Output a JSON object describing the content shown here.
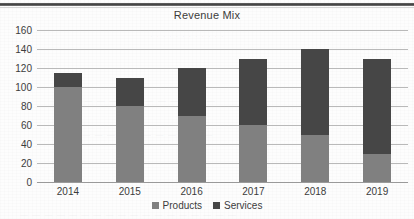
{
  "page": {
    "top_rule": "horizontal-rule"
  },
  "chart_data": {
    "type": "bar",
    "subtype": "stacked-bar",
    "title": "Revenue Mix",
    "xlabel": "",
    "ylabel": "",
    "categories": [
      "2014",
      "2015",
      "2016",
      "2017",
      "2018",
      "2019"
    ],
    "series": [
      {
        "name": "Products",
        "color": "#808080",
        "values": [
          100,
          80,
          70,
          60,
          50,
          30
        ]
      },
      {
        "name": "Services",
        "color": "#464646",
        "values": [
          15,
          30,
          50,
          70,
          90,
          100
        ]
      }
    ],
    "totals": [
      115,
      110,
      120,
      130,
      140,
      130
    ],
    "ylim": [
      0,
      160
    ],
    "ytick_step": 20,
    "yticks": [
      "160",
      "140",
      "120",
      "100",
      "80",
      "60",
      "40",
      "20",
      "0"
    ],
    "grid": true,
    "legend_position": "bottom"
  },
  "legend": {
    "items": [
      {
        "label": "Products",
        "swatch": "products-swatch"
      },
      {
        "label": "Services",
        "swatch": "services-swatch"
      }
    ]
  }
}
